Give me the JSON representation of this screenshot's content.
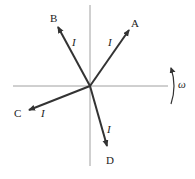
{
  "diagram": {
    "title": "",
    "phasors": [
      {
        "name": "A",
        "magnitude_label": "I",
        "tip": [
          129,
          30
        ],
        "label_pos": [
          133,
          26
        ],
        "mag_pos": [
          109,
          45
        ]
      },
      {
        "name": "B",
        "magnitude_label": "I",
        "tip": [
          58,
          27
        ],
        "label_pos": [
          51,
          22
        ],
        "mag_pos": [
          73,
          45
        ]
      },
      {
        "name": "C",
        "magnitude_label": "I",
        "tip": [
          29,
          110
        ],
        "label_pos": [
          14,
          117
        ],
        "mag_pos": [
          41,
          117
        ]
      },
      {
        "name": "D",
        "magnitude_label": "I",
        "tip": [
          107,
          146
        ],
        "label_pos": [
          107,
          164
        ],
        "mag_pos": [
          107,
          133
        ]
      }
    ],
    "rotation": {
      "label": "ω",
      "direction": "counterclockwise"
    },
    "axes": {
      "horizontal": true,
      "vertical": true
    },
    "colors": {
      "arrow": "#333333",
      "axis": "#888888",
      "text": "#222222"
    }
  }
}
